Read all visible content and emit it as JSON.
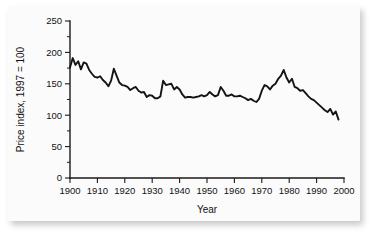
{
  "chart_data": {
    "type": "line",
    "title": "",
    "xlabel": "Year",
    "ylabel": "Price index, 1997 = 100",
    "xlim": [
      1900,
      2000
    ],
    "ylim": [
      0,
      250
    ],
    "xticks": [
      1900,
      1910,
      1920,
      1930,
      1940,
      1950,
      1960,
      1970,
      1980,
      1990,
      2000
    ],
    "yticks": [
      0,
      50,
      100,
      150,
      200,
      250
    ],
    "xtick_labels": [
      "1900",
      "1910",
      "1920",
      "1930",
      "1940",
      "1950",
      "1960",
      "1970",
      "1980",
      "1990",
      "2000"
    ],
    "ytick_labels": [
      "0",
      "50",
      "100",
      "150",
      "200",
      "250"
    ],
    "grid": false,
    "legend": null,
    "minor_ticks_y": [
      25,
      75,
      125,
      175,
      225
    ],
    "series": [
      {
        "name": "Price index, 1997 = 100",
        "x": [
          1900,
          1901,
          1902,
          1903,
          1904,
          1905,
          1906,
          1907,
          1908,
          1909,
          1910,
          1911,
          1912,
          1913,
          1914,
          1915,
          1916,
          1917,
          1918,
          1919,
          1920,
          1921,
          1922,
          1923,
          1924,
          1925,
          1926,
          1927,
          1928,
          1929,
          1930,
          1931,
          1932,
          1933,
          1934,
          1935,
          1936,
          1937,
          1938,
          1939,
          1940,
          1941,
          1942,
          1943,
          1944,
          1945,
          1946,
          1947,
          1948,
          1949,
          1950,
          1951,
          1952,
          1953,
          1954,
          1955,
          1956,
          1957,
          1958,
          1959,
          1960,
          1961,
          1962,
          1963,
          1964,
          1965,
          1966,
          1967,
          1968,
          1969,
          1970,
          1971,
          1972,
          1973,
          1974,
          1975,
          1976,
          1977,
          1978,
          1979,
          1980,
          1981,
          1982,
          1983,
          1984,
          1985,
          1986,
          1987,
          1988,
          1989,
          1990,
          1991,
          1992,
          1993,
          1994,
          1995,
          1996,
          1997,
          1998
        ],
        "values": [
          176,
          191,
          180,
          186,
          173,
          184,
          182,
          172,
          166,
          161,
          160,
          162,
          156,
          152,
          146,
          155,
          174,
          163,
          152,
          148,
          147,
          145,
          140,
          143,
          145,
          139,
          136,
          137,
          129,
          132,
          131,
          127,
          127,
          130,
          155,
          148,
          149,
          150,
          141,
          145,
          141,
          133,
          128,
          129,
          129,
          128,
          129,
          130,
          132,
          130,
          132,
          137,
          133,
          130,
          132,
          145,
          139,
          131,
          131,
          133,
          130,
          130,
          131,
          129,
          127,
          124,
          126,
          123,
          121,
          126,
          139,
          148,
          146,
          141,
          147,
          150,
          158,
          163,
          172,
          160,
          152,
          158,
          145,
          143,
          139,
          140,
          135,
          130,
          126,
          124,
          120,
          116,
          112,
          108,
          105,
          110,
          101,
          106,
          93
        ]
      }
    ]
  }
}
